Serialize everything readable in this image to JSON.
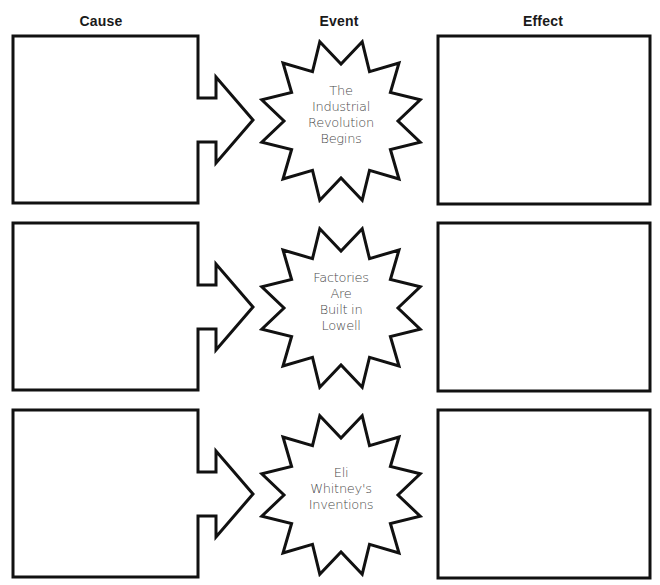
{
  "headers": {
    "cause": "Cause",
    "event": "Event",
    "effect": "Effect"
  },
  "style": {
    "stroke_color": "#111111",
    "stroke_width": 3,
    "text_color": "#4a4a4a",
    "background": "#ffffff"
  },
  "rows": [
    {
      "cause_text": "",
      "event_lines": [
        "The",
        "Industrial",
        "Revolution",
        "Begins"
      ],
      "event_text": "The Industrial Revolution Begins",
      "effect_text": ""
    },
    {
      "cause_text": "",
      "event_lines": [
        "Factories",
        "Are",
        "Built in",
        "Lowell"
      ],
      "event_text": "Factories Are Built in Lowell",
      "effect_text": ""
    },
    {
      "cause_text": "",
      "event_lines": [
        "Eli",
        "Whitney's",
        "Inventions"
      ],
      "event_text": "Eli Whitney's Inventions",
      "effect_text": ""
    }
  ]
}
